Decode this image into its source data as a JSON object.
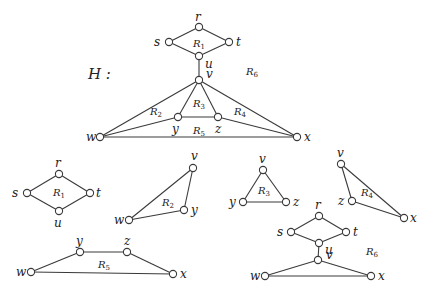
{
  "title": "H :",
  "graphs": [
    {
      "id": "H",
      "nodes": [
        {
          "id": "r",
          "x": 199,
          "y": 27,
          "label": "r",
          "lx": 195,
          "ly": 21
        },
        {
          "id": "s",
          "x": 169,
          "y": 42,
          "label": "s",
          "lx": 154,
          "ly": 46
        },
        {
          "id": "t",
          "x": 229,
          "y": 42,
          "label": "t",
          "lx": 236,
          "ly": 46
        },
        {
          "id": "u",
          "x": 199,
          "y": 56,
          "label": "u",
          "lx": 205,
          "ly": 68
        },
        {
          "id": "v",
          "x": 199,
          "y": 80,
          "label": "v",
          "lx": 206,
          "ly": 78
        },
        {
          "id": "y",
          "x": 178,
          "y": 117,
          "label": "y",
          "lx": 172,
          "ly": 133
        },
        {
          "id": "z",
          "x": 218,
          "y": 117,
          "label": "z",
          "lx": 215,
          "ly": 133
        },
        {
          "id": "w",
          "x": 100,
          "y": 137,
          "label": "w",
          "lx": 86,
          "ly": 141
        },
        {
          "id": "x",
          "x": 297,
          "y": 137,
          "label": "x",
          "lx": 304,
          "ly": 141
        }
      ],
      "edges": [
        [
          "r",
          "s"
        ],
        [
          "r",
          "t"
        ],
        [
          "s",
          "u"
        ],
        [
          "t",
          "u"
        ],
        [
          "u",
          "v"
        ],
        [
          "v",
          "w"
        ],
        [
          "v",
          "x"
        ],
        [
          "v",
          "y"
        ],
        [
          "v",
          "z"
        ],
        [
          "y",
          "z"
        ],
        [
          "w",
          "y"
        ],
        [
          "z",
          "x"
        ],
        [
          "w",
          "x"
        ]
      ],
      "regions": [
        {
          "name": "R",
          "sub": "1",
          "x": 193,
          "y": 47
        },
        {
          "name": "R",
          "sub": "6",
          "x": 246,
          "y": 75
        },
        {
          "name": "R",
          "sub": "3",
          "x": 193,
          "y": 107
        },
        {
          "name": "R",
          "sub": "2",
          "x": 150,
          "y": 115
        },
        {
          "name": "R",
          "sub": "4",
          "x": 234,
          "y": 115
        },
        {
          "name": "R",
          "sub": "5",
          "x": 193,
          "y": 134
        }
      ]
    },
    {
      "id": "R1",
      "nodes": [
        {
          "id": "r",
          "x": 59,
          "y": 174,
          "label": "r",
          "lx": 55,
          "ly": 167
        },
        {
          "id": "s",
          "x": 27,
          "y": 193,
          "label": "s",
          "lx": 12,
          "ly": 197
        },
        {
          "id": "t",
          "x": 90,
          "y": 193,
          "label": "t",
          "lx": 96,
          "ly": 197
        },
        {
          "id": "u",
          "x": 59,
          "y": 211,
          "label": "u",
          "lx": 54,
          "ly": 227
        }
      ],
      "edges": [
        [
          "r",
          "s"
        ],
        [
          "r",
          "t"
        ],
        [
          "s",
          "u"
        ],
        [
          "t",
          "u"
        ]
      ],
      "regions": [
        {
          "name": "R",
          "sub": "1",
          "x": 53,
          "y": 196
        }
      ]
    },
    {
      "id": "R2",
      "nodes": [
        {
          "id": "v",
          "x": 193,
          "y": 168,
          "label": "v",
          "lx": 191,
          "ly": 160
        },
        {
          "id": "w",
          "x": 129,
          "y": 220,
          "label": "w",
          "lx": 114,
          "ly": 224
        },
        {
          "id": "y",
          "x": 184,
          "y": 210,
          "label": "y",
          "lx": 191,
          "ly": 214
        }
      ],
      "edges": [
        [
          "v",
          "w"
        ],
        [
          "v",
          "y"
        ],
        [
          "w",
          "y"
        ]
      ],
      "regions": [
        {
          "name": "R",
          "sub": "2",
          "x": 162,
          "y": 206
        }
      ]
    },
    {
      "id": "R3",
      "nodes": [
        {
          "id": "v",
          "x": 263,
          "y": 170,
          "label": "v",
          "lx": 259,
          "ly": 163
        },
        {
          "id": "y",
          "x": 243,
          "y": 202,
          "label": "y",
          "lx": 229,
          "ly": 206
        },
        {
          "id": "z",
          "x": 286,
          "y": 202,
          "label": "z",
          "lx": 293,
          "ly": 206
        }
      ],
      "edges": [
        [
          "v",
          "y"
        ],
        [
          "v",
          "z"
        ],
        [
          "y",
          "z"
        ]
      ],
      "regions": [
        {
          "name": "R",
          "sub": "3",
          "x": 258,
          "y": 194
        }
      ]
    },
    {
      "id": "R4",
      "nodes": [
        {
          "id": "v",
          "x": 341,
          "y": 164,
          "label": "v",
          "lx": 337,
          "ly": 157
        },
        {
          "id": "z",
          "x": 352,
          "y": 201,
          "label": "z",
          "lx": 338,
          "ly": 205
        },
        {
          "id": "x",
          "x": 404,
          "y": 218,
          "label": "x",
          "lx": 410,
          "ly": 222
        }
      ],
      "edges": [
        [
          "v",
          "z"
        ],
        [
          "v",
          "x"
        ],
        [
          "z",
          "x"
        ]
      ],
      "regions": [
        {
          "name": "R",
          "sub": "4",
          "x": 361,
          "y": 196
        }
      ]
    },
    {
      "id": "R5",
      "nodes": [
        {
          "id": "y",
          "x": 80,
          "y": 252,
          "label": "y",
          "lx": 76,
          "ly": 245
        },
        {
          "id": "z",
          "x": 127,
          "y": 252,
          "label": "z",
          "lx": 124,
          "ly": 245
        },
        {
          "id": "w",
          "x": 31,
          "y": 272,
          "label": "w",
          "lx": 16,
          "ly": 276
        },
        {
          "id": "x",
          "x": 173,
          "y": 274,
          "label": "x",
          "lx": 180,
          "ly": 278
        }
      ],
      "edges": [
        [
          "w",
          "y"
        ],
        [
          "y",
          "z"
        ],
        [
          "z",
          "x"
        ],
        [
          "w",
          "x"
        ]
      ],
      "regions": [
        {
          "name": "R",
          "sub": "5",
          "x": 98,
          "y": 268
        }
      ]
    },
    {
      "id": "R6",
      "nodes": [
        {
          "id": "r",
          "x": 319,
          "y": 216,
          "label": "r",
          "lx": 315,
          "ly": 209
        },
        {
          "id": "s",
          "x": 291,
          "y": 232,
          "label": "s",
          "lx": 277,
          "ly": 236
        },
        {
          "id": "t",
          "x": 346,
          "y": 232,
          "label": "t",
          "lx": 353,
          "ly": 236
        },
        {
          "id": "u",
          "x": 319,
          "y": 243,
          "label": "u",
          "lx": 325,
          "ly": 254
        },
        {
          "id": "v",
          "x": 318,
          "y": 260,
          "label": "v",
          "lx": 326,
          "ly": 259
        },
        {
          "id": "w",
          "x": 265,
          "y": 276,
          "label": "w",
          "lx": 250,
          "ly": 280
        },
        {
          "id": "x",
          "x": 371,
          "y": 276,
          "label": "x",
          "lx": 378,
          "ly": 280
        }
      ],
      "edges": [
        [
          "r",
          "s"
        ],
        [
          "r",
          "t"
        ],
        [
          "s",
          "u"
        ],
        [
          "t",
          "u"
        ],
        [
          "u",
          "v"
        ],
        [
          "v",
          "w"
        ],
        [
          "v",
          "x"
        ],
        [
          "w",
          "x"
        ]
      ],
      "regions": [
        {
          "name": "R",
          "sub": "6",
          "x": 366,
          "y": 255
        }
      ]
    }
  ],
  "title_pos": {
    "x": 88,
    "y": 79
  },
  "style": {
    "line_color": "#3a3a3a",
    "node_fill": "#ffffff",
    "node_radius": 3.6
  }
}
